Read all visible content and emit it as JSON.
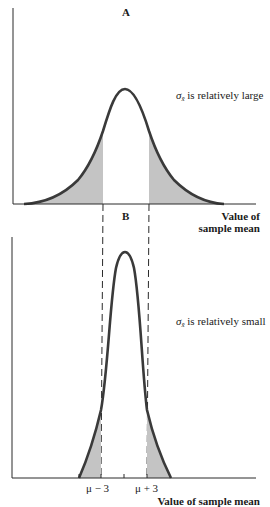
{
  "panels": {
    "a": {
      "title": "A",
      "sigma_symbol": "σ",
      "sigma_subscript": "x̄",
      "note": "is relatively large",
      "x_axis_title_line1": "Value of",
      "x_axis_title_line2": "sample mean"
    },
    "b": {
      "title": "B",
      "sigma_symbol": "σ",
      "sigma_subscript": "x̄",
      "note": "is relatively small",
      "x_axis_title": "Value of sample mean",
      "tick_left": "μ − 3",
      "tick_right": "μ + 3"
    }
  },
  "colors": {
    "curve": "#3a3a3a",
    "shade": "#c4c4c4",
    "axis": "#2a2a2a"
  }
}
